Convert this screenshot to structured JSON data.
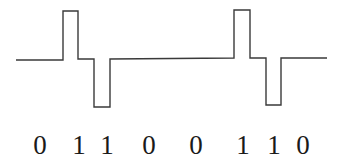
{
  "diagram": {
    "type": "line-code-waveform",
    "stroke_color": "#3a3a3a",
    "bits": [
      "0",
      "1",
      "1",
      "0",
      "0",
      "1",
      "1",
      "0"
    ],
    "bit_positions_x": [
      40,
      79,
      107,
      149,
      196,
      243,
      274,
      303
    ],
    "waveform_points": [
      [
        16,
        60
      ],
      [
        63,
        60
      ],
      [
        63,
        11
      ],
      [
        78,
        11
      ],
      [
        78,
        59
      ],
      [
        94,
        59
      ],
      [
        94,
        107
      ],
      [
        110,
        107
      ],
      [
        110,
        59
      ],
      [
        234,
        58
      ],
      [
        234,
        10
      ],
      [
        250,
        10
      ],
      [
        250,
        58
      ],
      [
        266,
        58
      ],
      [
        266,
        105
      ],
      [
        281,
        105
      ],
      [
        281,
        58
      ],
      [
        327,
        58
      ]
    ]
  }
}
